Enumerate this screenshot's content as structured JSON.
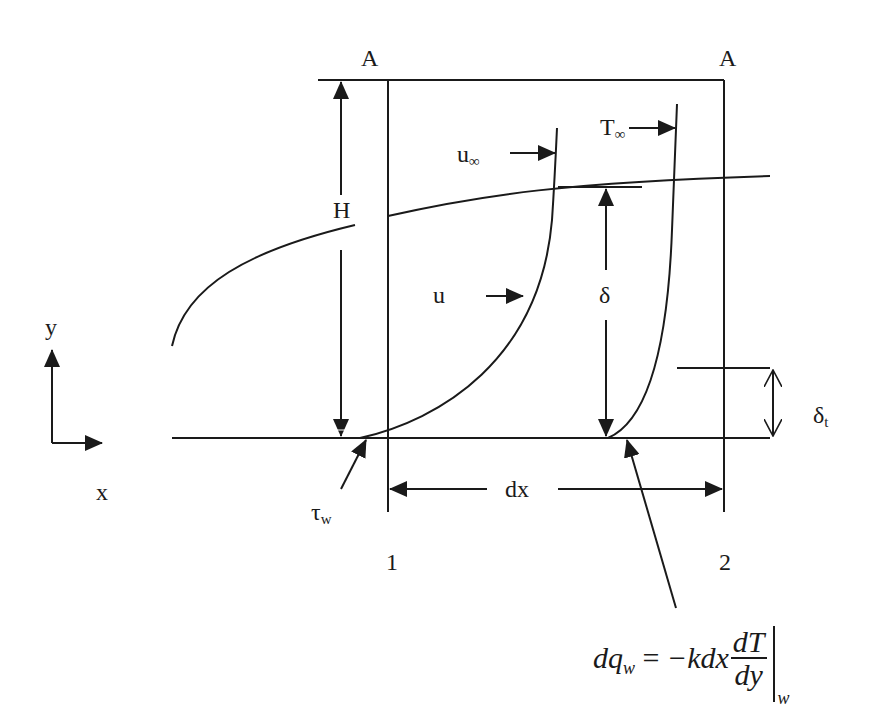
{
  "diagram": {
    "colors": {
      "ink": "#1a1a1a",
      "background": "#ffffff"
    },
    "labels": {
      "section_a_left": "A",
      "section_a_right": "A",
      "height": "H",
      "u_infinity": "u",
      "u_infinity_sub": "∞",
      "t_infinity": "T",
      "t_infinity_sub": "∞",
      "velocity": "u",
      "delta": "δ",
      "delta_t": "δ",
      "delta_t_sub": "t",
      "axis_y": "y",
      "axis_x": "x",
      "tau_w": "τ",
      "tau_w_sub": "w",
      "dx": "dx",
      "station_1": "1",
      "station_2": "2"
    },
    "equation": {
      "lhs": "dq",
      "lhs_sub": "w",
      "equals": " = ",
      "rhs_prefix": "−kdx",
      "frac_num": "dT",
      "frac_den": "dy",
      "eval_sub": "w"
    }
  }
}
